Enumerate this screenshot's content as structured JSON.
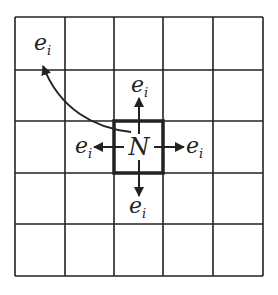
{
  "diagram": {
    "grid": {
      "rows": 5,
      "cols": 5,
      "x_lines": [
        15,
        65,
        114,
        163,
        213,
        263
      ],
      "y_lines": [
        17,
        70,
        121,
        173,
        224,
        276
      ],
      "line_color": "#222"
    },
    "center_cell": {
      "label": "N",
      "row": 2,
      "col": 2
    },
    "edge_labels": {
      "top": "e",
      "bottom": "e",
      "left": "e",
      "right": "e",
      "far": "e"
    },
    "subscript": "i"
  }
}
